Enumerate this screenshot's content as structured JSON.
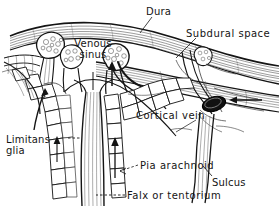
{
  "figure": {
    "style": "black-and-white line drawing",
    "background_color": "#ffffff",
    "ink_color": "#141414",
    "width": 279,
    "height": 208
  },
  "labels": {
    "dura": "Dura",
    "subdural_space": "Subdural  space",
    "venous_sinus_line1": "Venous",
    "venous_sinus_line2": "sinus",
    "cortical_vein": "Cortical  vein",
    "limitans_line1": "Limitans",
    "limitans_line2": "glia",
    "pia_arachnoid": "Pia  arachnoid",
    "sulcus": "Sulcus",
    "falx_or_tentorium": "Falx  or  tentorium"
  },
  "structures": [
    {
      "name": "dura-mater-band",
      "description": "hatched curved band across top"
    },
    {
      "name": "subdural-space",
      "description": "thin gap beneath dura"
    },
    {
      "name": "superior-sagittal-sinus",
      "description": "venous sinus lumen"
    },
    {
      "name": "arachnoid-villus-left",
      "description": "granular knob projecting into sinus"
    },
    {
      "name": "arachnoid-villus-center",
      "description": "granular knob projecting into sinus"
    },
    {
      "name": "arachnoid-villus-right",
      "description": "granular knob at right"
    },
    {
      "name": "cortical-vein",
      "description": "vein curving into sinus"
    },
    {
      "name": "venous-lacuna",
      "description": "dark filled ellipse at right"
    },
    {
      "name": "falx-cerebri",
      "description": "vertical fibrous septum"
    },
    {
      "name": "cortex-cell-layer",
      "description": "polygonal cell mosaic lining cortex"
    },
    {
      "name": "limitans-glia-layer",
      "description": "glial limiting membrane"
    },
    {
      "name": "pia-arachnoid-membrane",
      "description": "membrane over cortex"
    },
    {
      "name": "sulcus-channel",
      "description": "narrow descending cortical fold"
    },
    {
      "name": "flow-arrow-right",
      "description": "arrow pointing left into lacuna"
    },
    {
      "name": "flow-arrow-left-villus",
      "description": "arrow into left villus"
    },
    {
      "name": "flow-arrow-center-villus",
      "description": "arrow into center villus"
    },
    {
      "name": "flow-arrow-falx-right",
      "description": "arrow ascending beside falx"
    }
  ]
}
